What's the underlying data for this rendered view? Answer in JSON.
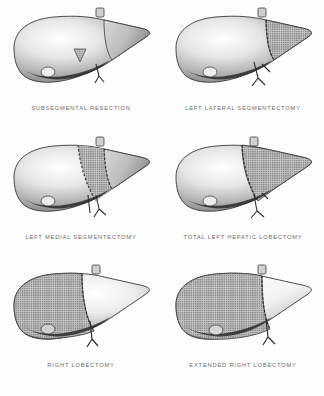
{
  "plate": {
    "title": "Types of Hepatic Resection",
    "background_color": "#fdfdfd",
    "ink_color": "#6d6d6d",
    "columns": 2,
    "rows": 3
  },
  "panels": [
    {
      "index": 1,
      "caption": "SUBSEGMENTAL RESECTION",
      "resection_region": "small wedge at inferior margin of medial segment",
      "stipple_shape": "small-triangle",
      "margin_line": "none"
    },
    {
      "index": 2,
      "caption": "LEFT LATERAL SEGMENTECTOMY",
      "resection_region": "left lateral segment, right portion of illustration",
      "stipple_shape": "lateral-wedge",
      "margin_line": "vertical-dashed"
    },
    {
      "index": 3,
      "caption": "LEFT MEDIAL SEGMENTECTOMY",
      "resection_region": "central medial segment band",
      "stipple_shape": "central-band",
      "margin_line": "double-vertical-dashed"
    },
    {
      "index": 4,
      "caption": "TOTAL LEFT HEPATIC LOBECTOMY",
      "resection_region": "entire left lobe",
      "stipple_shape": "left-lobe",
      "margin_line": "vertical-dashed"
    },
    {
      "index": 5,
      "caption": "RIGHT LOBECTOMY",
      "resection_region": "entire right lobe",
      "stipple_shape": "right-lobe",
      "margin_line": "vertical-dashed"
    },
    {
      "index": 6,
      "caption": "EXTENDED RIGHT LOBECTOMY",
      "resection_region": "right lobe plus medial segment",
      "stipple_shape": "right-lobe-extended",
      "margin_line": "vertical-dashed"
    }
  ]
}
